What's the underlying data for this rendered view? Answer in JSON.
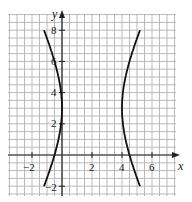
{
  "chart_data": {
    "type": "line",
    "title": "",
    "xlabel": "x",
    "ylabel": "y",
    "xlim": [
      -3,
      7
    ],
    "ylim": [
      -3,
      9
    ],
    "grid": true,
    "grid_step": 0.5,
    "x_ticks": [
      "-2",
      "2",
      "4",
      "6"
    ],
    "y_ticks": [
      "-2",
      "2",
      "4",
      "6",
      "8"
    ],
    "curve": "hyperbola",
    "center": [
      2,
      3
    ],
    "vertices": [
      [
        0,
        3
      ],
      [
        4,
        3
      ]
    ],
    "series": [
      {
        "name": "left branch",
        "x": [
          -1.2,
          -0.8,
          -0.4,
          0,
          -0.4,
          -0.8,
          -1.3
        ],
        "y": [
          8,
          6.5,
          5,
          3,
          1,
          -0.5,
          -2
        ]
      },
      {
        "name": "right branch",
        "x": [
          5.2,
          4.8,
          4.4,
          4,
          4.4,
          4.8,
          5.3
        ],
        "y": [
          8,
          6.5,
          5,
          3,
          1,
          -0.5,
          -2
        ]
      }
    ]
  },
  "labels": {
    "x_axis": "x",
    "y_axis": "y",
    "tick_x_neg2": "−2",
    "tick_x_2": "2",
    "tick_x_4": "4",
    "tick_x_6": "6",
    "tick_y_neg2": "−2",
    "tick_y_2": "2",
    "tick_y_4": "4",
    "tick_y_6": "6",
    "tick_y_8": "8"
  }
}
